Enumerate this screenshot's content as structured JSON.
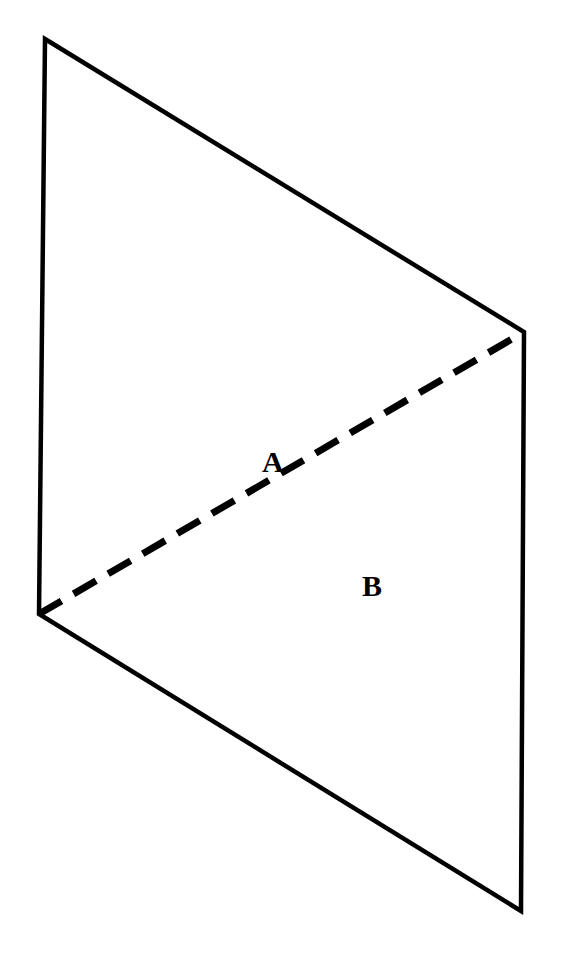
{
  "figure": {
    "background_color": "#ffffff",
    "stroke_color": "#000000",
    "canvas": {
      "width": 563,
      "height": 969
    },
    "vertices": {
      "top_left": {
        "id": "P1",
        "x": 45,
        "y": 39
      },
      "top_right": {
        "id": "P2",
        "x": 524,
        "y": 332
      },
      "bottom_right": {
        "id": "P3",
        "x": 521,
        "y": 911
      },
      "mid_left": {
        "id": "P4",
        "x": 39,
        "y": 614
      }
    },
    "outline": {
      "name": "parallelogram-outline",
      "points": "45,39 524,332 521,911 39,614",
      "stroke_width": 4.5,
      "fill": "none",
      "line_style": "solid"
    },
    "diagonal": {
      "name": "dashed-diagonal",
      "from": {
        "x": 39,
        "y": 614
      },
      "to": {
        "x": 524,
        "y": 332
      },
      "stroke_width": 7,
      "line_style": "dashed",
      "dash_length": 26,
      "gap_length": 14
    },
    "labels": [
      {
        "id": "A",
        "text": "A",
        "x": 262,
        "y": 447,
        "region": "upper-triangle"
      },
      {
        "id": "B",
        "text": "B",
        "x": 362,
        "y": 571,
        "region": "lower-triangle"
      }
    ]
  },
  "chart_data": {
    "type": "diagram",
    "title": "",
    "shapes": [
      {
        "name": "parallelogram",
        "kind": "polygon",
        "points": [
          [
            45,
            39
          ],
          [
            524,
            332
          ],
          [
            521,
            911
          ],
          [
            39,
            614
          ]
        ],
        "stroke": "#000000",
        "stroke_width": 4.5,
        "fill": "none",
        "dash": false
      },
      {
        "name": "diagonal-divider",
        "kind": "line",
        "points": [
          [
            39,
            614
          ],
          [
            524,
            332
          ]
        ],
        "stroke": "#000000",
        "stroke_width": 7,
        "fill": "none",
        "dash": true
      }
    ],
    "annotations": [
      {
        "text": "A",
        "x": 272,
        "y": 462
      },
      {
        "text": "B",
        "x": 372,
        "y": 586
      }
    ],
    "xlabel": "",
    "ylabel": "",
    "legend": []
  }
}
